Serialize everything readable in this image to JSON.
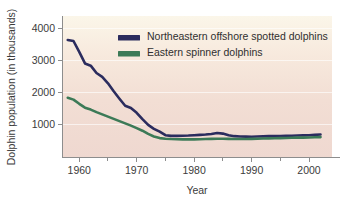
{
  "chart_data": {
    "type": "line",
    "title": "",
    "xlabel": "Year",
    "ylabel": "Dolphin population (in thousands)",
    "xlim": [
      1957,
      2004
    ],
    "ylim": [
      0,
      4400
    ],
    "xticks": [
      1960,
      1970,
      1980,
      1990,
      2000
    ],
    "xtick_labels": [
      "1960",
      "1970",
      "1980",
      "1990",
      "2000"
    ],
    "xminor_ticks": [
      1965,
      1975,
      1985,
      1995
    ],
    "yticks": [
      1000,
      2000,
      3000,
      4000
    ],
    "ytick_labels": [
      "1000",
      "2000",
      "3000",
      "4000"
    ],
    "grid": "horizontal",
    "legend_position": "top-center",
    "series": [
      {
        "name": "Northeastern offshore spotted dolphins",
        "color": "#2b2c5e",
        "x": [
          1958,
          1959,
          1960,
          1961,
          1962,
          1963,
          1964,
          1965,
          1966,
          1967,
          1968,
          1969,
          1970,
          1971,
          1972,
          1973,
          1974,
          1975,
          1976,
          1977,
          1978,
          1979,
          1980,
          1981,
          1982,
          1983,
          1984,
          1985,
          1986,
          1987,
          1988,
          1989,
          1990,
          1991,
          1992,
          1993,
          1994,
          1995,
          1996,
          1997,
          1998,
          1999,
          2000,
          2001,
          2002
        ],
        "values": [
          3650,
          3620,
          3280,
          2920,
          2850,
          2620,
          2500,
          2300,
          2050,
          1820,
          1600,
          1530,
          1380,
          1180,
          1000,
          880,
          790,
          680,
          660,
          660,
          665,
          670,
          680,
          690,
          700,
          720,
          750,
          730,
          680,
          650,
          640,
          635,
          630,
          640,
          645,
          650,
          650,
          655,
          660,
          665,
          670,
          675,
          680,
          690,
          700
        ]
      },
      {
        "name": "Eastern spinner dolphins",
        "color": "#3c7a57",
        "x": [
          1958,
          1959,
          1960,
          1961,
          1962,
          1963,
          1964,
          1965,
          1966,
          1967,
          1968,
          1969,
          1970,
          1971,
          1972,
          1973,
          1974,
          1975,
          1976,
          1977,
          1978,
          1979,
          1980,
          1981,
          1982,
          1983,
          1984,
          1985,
          1986,
          1987,
          1988,
          1989,
          1990,
          1991,
          1992,
          1993,
          1994,
          1995,
          1996,
          1997,
          1998,
          1999,
          2000,
          2001,
          2002
        ],
        "values": [
          1850,
          1790,
          1660,
          1540,
          1480,
          1400,
          1330,
          1260,
          1190,
          1120,
          1050,
          980,
          900,
          820,
          720,
          640,
          590,
          570,
          560,
          555,
          550,
          550,
          550,
          555,
          560,
          565,
          570,
          570,
          565,
          560,
          560,
          560,
          565,
          570,
          575,
          580,
          585,
          590,
          595,
          600,
          605,
          605,
          610,
          615,
          620
        ]
      }
    ]
  },
  "legend": {
    "items": [
      {
        "label": "Northeastern offshore spotted dolphins",
        "color": "#2b2c5e"
      },
      {
        "label": "Eastern spinner dolphins",
        "color": "#3c7a57"
      }
    ]
  },
  "axes": {
    "y_title": "Dolphin population (in thousands)",
    "x_title": "Year"
  },
  "colors": {
    "panel_top": "#faf4e6",
    "panel_bottom": "#f0d7cf",
    "page_background": "#ffffff",
    "axis": "#8d8d8d",
    "text": "#3b3b3b"
  }
}
